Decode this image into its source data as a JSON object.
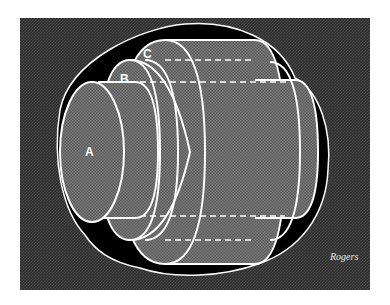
{
  "diagram": {
    "type": "nested-cylinders",
    "labels": {
      "a": "A",
      "b": "B",
      "c": "C"
    },
    "signature": "Rogers",
    "colors": {
      "background": "#ffffff",
      "panel": "#2e2e2e",
      "fill": "#6a6a6a",
      "outline": "#ffffff",
      "shadow": "#000000"
    }
  }
}
